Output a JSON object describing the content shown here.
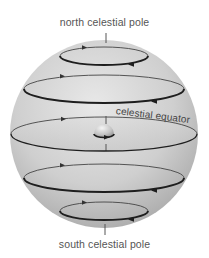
{
  "diagram": {
    "labels": {
      "north_pole": "north celestial pole",
      "south_pole": "south celestial pole",
      "equator": "celestial equator"
    },
    "elements": {
      "sphere": {
        "shape": "sphere",
        "fill": "#c9c9c9",
        "cx": 104,
        "cy": 134,
        "r": 94
      },
      "earth": {
        "shape": "small-sphere-center",
        "cx": 104,
        "cy": 134,
        "r": 10
      },
      "axis": {
        "shape": "line-through-poles"
      },
      "circles": [
        {
          "name": "north-circle",
          "cx": 104,
          "cy": 56,
          "rx": 44,
          "ry": 9
        },
        {
          "name": "upper-mid-circle",
          "cx": 104,
          "cy": 89,
          "rx": 80,
          "ry": 14
        },
        {
          "name": "celestial-equator",
          "cx": 104,
          "cy": 134,
          "rx": 93,
          "ry": 17
        },
        {
          "name": "lower-mid-circle",
          "cx": 104,
          "cy": 178,
          "rx": 80,
          "ry": 14
        },
        {
          "name": "south-circle",
          "cx": 104,
          "cy": 211,
          "rx": 44,
          "ry": 9
        }
      ],
      "arrow_direction": "counterclockwise-viewed-from-north (front arrows point left, back arrows point right)"
    },
    "colors": {
      "sphere_light": "#e6e6e6",
      "sphere_dark": "#a8a8a8",
      "line": "#2a2a2a",
      "text": "#555555"
    }
  }
}
